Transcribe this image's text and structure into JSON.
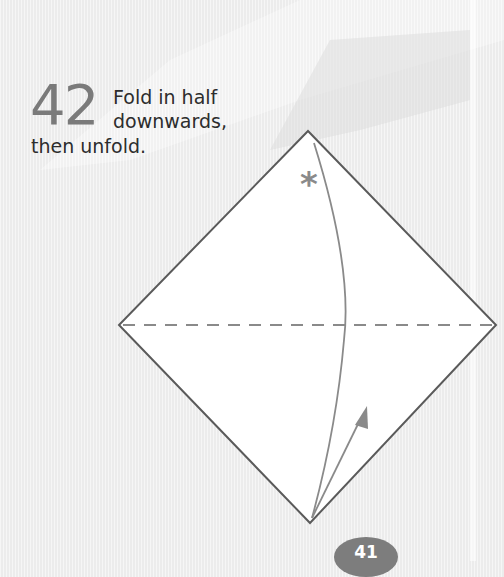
{
  "step": {
    "number": "42",
    "instruction_lines": [
      "Fold in half",
      "downwards,",
      "then unfold."
    ]
  },
  "diagram": {
    "shape": "square paper rotated 45° (diamond)",
    "fold_line": "horizontal valley fold (dashed) through center",
    "marker": "*",
    "arrow": "curved fold arrow from top corner to bottom corner and back up (unfold)",
    "colors": {
      "paper": "#ffffff",
      "outline": "#5a5a5a",
      "annotation": "#8a8a8a",
      "background": "#ececec"
    }
  },
  "page": {
    "number": "41"
  }
}
